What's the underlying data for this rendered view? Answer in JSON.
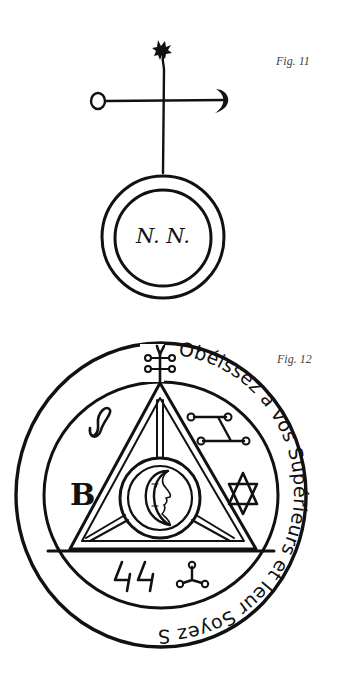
{
  "figures": [
    {
      "label": "Fig. 11",
      "center_text": "N. N.",
      "elements": [
        "star-top",
        "vertical-staff",
        "crossbar",
        "circle-end-left",
        "crescent-end-right",
        "double-ring-seal"
      ]
    },
    {
      "label": "Fig. 12",
      "ring_text": "Obéissez a vos Supérieurs et leur Soyez Soumis par ce quils y prennent garde",
      "inner_letter": "B",
      "bottom_glyphs": "ԿԿ",
      "elements": [
        "outer-ring",
        "inner-ring",
        "triangle",
        "crescent-moon-face-medallion",
        "figure-eight-sigil",
        "dot-linked-sigil",
        "star-of-david",
        "trefoil-sigil",
        "top-knot-sigil"
      ]
    }
  ],
  "colors": {
    "ink": "#111111",
    "background": "#ffffff",
    "caption": "#444444"
  }
}
